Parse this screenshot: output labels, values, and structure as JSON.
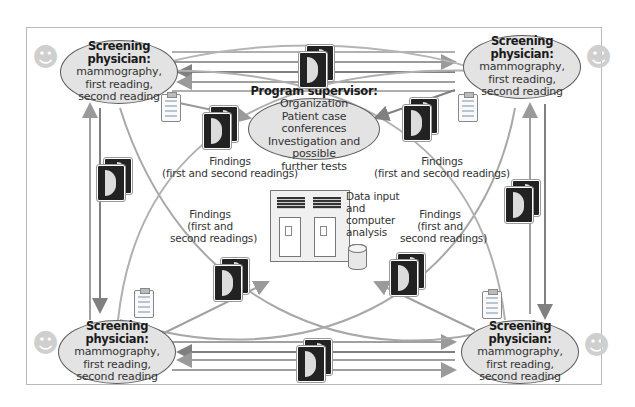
{
  "diagram": {
    "screening_physicians": [
      {
        "position": "top-left",
        "title": "Screening physician:",
        "lines": [
          "mammography,",
          "first reading,",
          "second reading"
        ]
      },
      {
        "position": "top-right",
        "title": "Screening physician:",
        "lines": [
          "mammography,",
          "first reading,",
          "second reading"
        ]
      },
      {
        "position": "bottom-left",
        "title": "Screening physician:",
        "lines": [
          "mammography,",
          "first reading,",
          "second reading"
        ]
      },
      {
        "position": "bottom-right",
        "title": "Screening physician:",
        "lines": [
          "mammography,",
          "first reading,",
          "second reading"
        ]
      }
    ],
    "program_supervisor": {
      "title": "Program supervisor:",
      "lines": [
        "Organization",
        "Patient case conferences",
        "Investigation and possible",
        "further tests"
      ]
    },
    "findings_labels": [
      {
        "position": "upper-left",
        "lines": [
          "Findings",
          "(first and second readings)"
        ]
      },
      {
        "position": "upper-right",
        "lines": [
          "Findings",
          "(first and second readings)"
        ]
      },
      {
        "position": "middle-left",
        "lines": [
          "Findings",
          "(first and",
          "second readings)"
        ]
      },
      {
        "position": "middle-right",
        "lines": [
          "Findings",
          "(first and",
          "second readings)"
        ]
      }
    ],
    "data_center": {
      "lines": [
        "Data input",
        "and",
        "computer",
        "analysis"
      ],
      "icons": [
        "computer-rack-icon",
        "database-cylinder-icon"
      ]
    },
    "colors": {
      "ellipse_fill": "#e3e3e3",
      "ellipse_border": "#5a5a5a",
      "arrow_gray": "#a8a8a8",
      "arrow_dark": "#7a7a7a",
      "film_dark": "#222222",
      "frame_border": "#b9b9b9"
    }
  }
}
